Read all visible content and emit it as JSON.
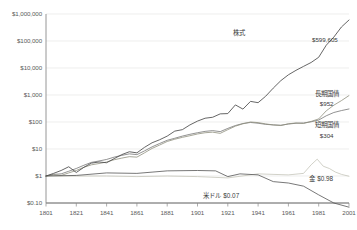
{
  "chart_data": {
    "type": "line",
    "title": "",
    "subtitle": "",
    "xlabel": "",
    "ylabel": "",
    "log_y": true,
    "grid": true,
    "legend_position": "inline-annotations",
    "xlim": [
      1801,
      2001
    ],
    "ylim": [
      0.1,
      1000000
    ],
    "x_ticks": [
      "1801",
      "1821",
      "1841",
      "1861",
      "1881",
      "1901",
      "1921",
      "1941",
      "1961",
      "1981",
      "2001"
    ],
    "y_ticks": [
      "$1,000,000",
      "$100,000",
      "$10,000",
      "$1,000",
      "$100",
      "$10",
      "$1",
      "$0.10"
    ],
    "y_tick_values": [
      1000000,
      100000,
      10000,
      1000,
      100,
      10,
      1,
      0.1
    ],
    "series": [
      {
        "name": "株式",
        "end_label": "$599,605",
        "color": "#4a4a4a",
        "x": [
          1801,
          1806,
          1811,
          1816,
          1821,
          1826,
          1831,
          1836,
          1841,
          1846,
          1851,
          1856,
          1861,
          1866,
          1871,
          1876,
          1881,
          1886,
          1891,
          1896,
          1901,
          1906,
          1911,
          1916,
          1921,
          1926,
          1931,
          1936,
          1941,
          1946,
          1951,
          1956,
          1961,
          1966,
          1971,
          1976,
          1981,
          1986,
          1991,
          1996,
          2001
        ],
        "values": [
          1,
          1.25,
          1.6,
          2.2,
          1.35,
          2.1,
          3.0,
          3.3,
          3.1,
          4.4,
          6.2,
          7.9,
          7.2,
          11.5,
          17,
          22,
          30,
          46,
          52,
          78,
          108,
          138,
          150,
          200,
          205,
          430,
          300,
          580,
          520,
          900,
          1800,
          3400,
          5600,
          8200,
          11500,
          16000,
          25000,
          70000,
          140000,
          330000,
          599605
        ]
      },
      {
        "name": "長期国債",
        "end_label": "$952",
        "color": "#8f8f7e",
        "x": [
          1801,
          1806,
          1811,
          1816,
          1821,
          1826,
          1831,
          1836,
          1841,
          1846,
          1851,
          1856,
          1861,
          1866,
          1871,
          1876,
          1881,
          1886,
          1891,
          1896,
          1901,
          1906,
          1911,
          1916,
          1921,
          1926,
          1931,
          1936,
          1941,
          1946,
          1951,
          1956,
          1961,
          1966,
          1971,
          1976,
          1981,
          1986,
          1991,
          1996,
          2001
        ],
        "values": [
          1,
          1.1,
          1.05,
          1.3,
          1.6,
          2.1,
          2.6,
          2.9,
          3.3,
          4.0,
          4.6,
          5.2,
          5.0,
          7.2,
          10.5,
          14,
          19,
          23,
          27,
          31,
          36,
          40,
          42,
          38,
          52,
          70,
          86,
          100,
          95,
          85,
          78,
          74,
          86,
          92,
          88,
          105,
          130,
          260,
          420,
          620,
          952
        ]
      },
      {
        "name": "短期国債",
        "end_label": "$304",
        "color": "#6e6e6e",
        "x": [
          1801,
          1806,
          1811,
          1816,
          1821,
          1826,
          1831,
          1836,
          1841,
          1846,
          1851,
          1856,
          1861,
          1866,
          1871,
          1876,
          1881,
          1886,
          1891,
          1896,
          1901,
          1906,
          1911,
          1916,
          1921,
          1926,
          1931,
          1936,
          1941,
          1946,
          1951,
          1956,
          1961,
          1966,
          1971,
          1976,
          1981,
          1986,
          1991,
          1996,
          2001
        ],
        "values": [
          1,
          1.15,
          1.2,
          1.5,
          1.9,
          2.5,
          3.2,
          3.6,
          4.1,
          5.0,
          5.8,
          6.6,
          6.2,
          8.5,
          12,
          16,
          21,
          25,
          30,
          35,
          40,
          45,
          48,
          44,
          58,
          74,
          88,
          96,
          90,
          82,
          78,
          76,
          84,
          90,
          92,
          102,
          118,
          170,
          225,
          265,
          304
        ]
      },
      {
        "name": "金",
        "end_label": "$0.98",
        "color": "#c2c2b5",
        "x": [
          1801,
          1821,
          1841,
          1861,
          1881,
          1901,
          1921,
          1941,
          1961,
          1971,
          1976,
          1980,
          1984,
          1988,
          1992,
          1996,
          2001
        ],
        "values": [
          1,
          1.0,
          1.0,
          0.95,
          1.0,
          0.95,
          0.85,
          1.2,
          1.1,
          1.25,
          2.6,
          4.2,
          2.3,
          1.9,
          1.4,
          1.15,
          0.98
        ]
      },
      {
        "name": "米ドル",
        "end_label": "$0.07",
        "color": "#555555",
        "x": [
          1801,
          1821,
          1841,
          1861,
          1881,
          1901,
          1913,
          1921,
          1929,
          1941,
          1951,
          1961,
          1971,
          1981,
          1991,
          2001
        ],
        "values": [
          1,
          1.05,
          1.3,
          1.25,
          1.55,
          1.6,
          1.55,
          0.95,
          1.2,
          1.1,
          0.62,
          0.55,
          0.42,
          0.2,
          0.1,
          0.07
        ]
      }
    ],
    "annotations": [
      {
        "id": "stocks-name",
        "text": "株式",
        "x_pct": 67.0,
        "y_pct": 12.5
      },
      {
        "id": "stocks-value",
        "text": "$599,605",
        "x_pct": 91.0,
        "y_pct": 15.5
      },
      {
        "id": "ltbonds-name",
        "text": "長期国債",
        "x_pct": 91.5,
        "y_pct": 39.0
      },
      {
        "id": "ltbonds-value",
        "text": "$952",
        "x_pct": 91.5,
        "y_pct": 43.5
      },
      {
        "id": "stbonds-name",
        "text": "短期国債",
        "x_pct": 91.5,
        "y_pct": 52.8
      },
      {
        "id": "stbonds-value",
        "text": "$304",
        "x_pct": 91.5,
        "y_pct": 57.2
      },
      {
        "id": "gold-label",
        "text": "金 $0.98",
        "x_pct": 90.0,
        "y_pct": 76.2
      },
      {
        "id": "dollar-label",
        "text": "米ドル   $0.07",
        "x_pct": 62.0,
        "y_pct": 83.5
      }
    ]
  }
}
